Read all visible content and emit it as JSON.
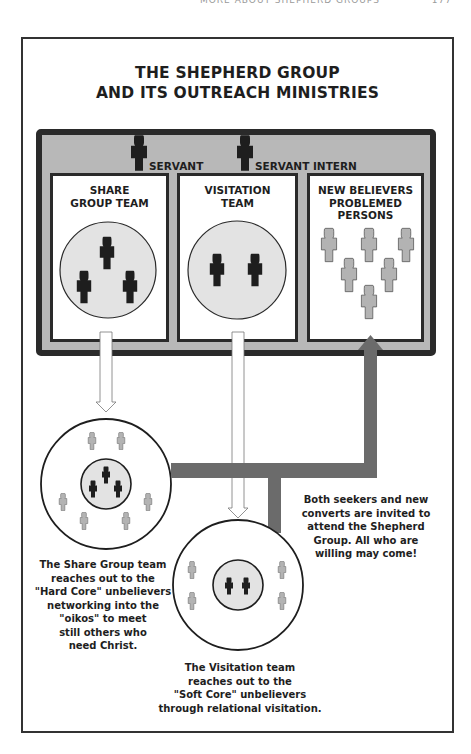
{
  "running_head": {
    "text": "MORE ABOUT SHEPHERD GROUPS",
    "page_number": "177"
  },
  "title": {
    "line1": "THE SHEPHERD GROUP",
    "line2": "AND ITS OUTREACH MINISTRIES"
  },
  "roles": {
    "servant": "SERVANT",
    "servant_intern": "SERVANT INTERN"
  },
  "teams": [
    {
      "line1": "SHARE",
      "line2": "GROUP TEAM",
      "members": 3
    },
    {
      "line1": "VISITATION",
      "line2": "TEAM",
      "members": 2
    },
    {
      "line1": "NEW BELIEVERS",
      "line2": "PROBLEMED",
      "line3": "PERSONS",
      "members": 6
    }
  ],
  "outreach": {
    "share_group": {
      "caption": [
        "The Share Group team",
        "reaches out to the",
        "\"Hard Core\" unbelievers",
        "networking into the",
        "\"oikos\" to meet",
        "still others who",
        "need Christ."
      ],
      "team_members": 3,
      "unbelievers": 6
    },
    "visitation": {
      "caption": [
        "The Visitation team",
        "reaches out to the",
        "\"Soft Core\" unbelievers",
        "through relational visitation."
      ],
      "team_members": 2,
      "unbelievers": 4
    },
    "invitation_note": [
      "Both seekers and new",
      "converts are invited to",
      "attend the Shepherd",
      "Group. All who are",
      "willing may come!"
    ]
  },
  "colors": {
    "frame": "#333333",
    "grey_box": "#b8b8b8",
    "dark_border": "#2a2a2a",
    "leader_figure": "#1e1e1e",
    "light_figure": "#b3b3b3",
    "circle_fill": "#e3e3e3",
    "flow_arrow": "#6b6b6b"
  }
}
